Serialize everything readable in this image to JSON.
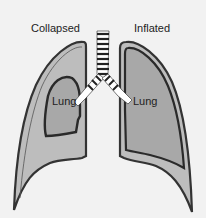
{
  "diagram": {
    "labels": {
      "left_title": "Collapsed",
      "right_title": "Inflated",
      "left_lung": "Lung",
      "right_lung": "Lung"
    },
    "colors": {
      "background": "#f2f2f2",
      "pleura_fill": "#b8b8b8",
      "lung_fill": "#a9a9a9",
      "outline": "#333333",
      "airway_fill": "#ffffff"
    }
  }
}
